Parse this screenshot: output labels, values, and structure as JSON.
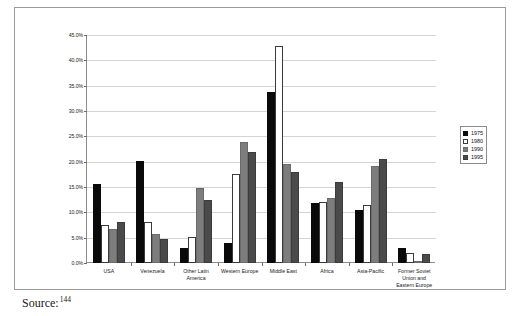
{
  "document": {
    "source_label": "Source:",
    "source_footnote": "144"
  },
  "legend": {
    "position": "right",
    "entries": [
      {
        "label": "1975",
        "color": "#0a0a0a"
      },
      {
        "label": "1980",
        "color": "#ffffff"
      },
      {
        "label": "1990",
        "color": "#7d7d7d"
      },
      {
        "label": "1995",
        "color": "#4a4a4a"
      }
    ]
  },
  "axis": {
    "y_ticks": [
      "0.0%",
      "5.0%",
      "10.0%",
      "15.0%",
      "20.0%",
      "25.0%",
      "30.0%",
      "35.0%",
      "40.0%",
      "45.0%"
    ]
  },
  "chart_data": {
    "type": "bar",
    "title": "",
    "subtitle": "",
    "xlabel": "",
    "ylabel": "",
    "ylim": [
      0,
      45
    ],
    "ytick_step": 5,
    "ytick_format": "percent",
    "grid": true,
    "legend_position": "right",
    "categories": [
      "USA",
      "Venezuela",
      "Other Latin\nAmerica",
      "Western Europe",
      "Middle East",
      "Africa",
      "Asia-Pacific",
      "Former Soviet\nUnion and\nEastern Europe"
    ],
    "series": [
      {
        "name": "1975",
        "color": "#0a0a0a",
        "values": [
          15.5,
          20.2,
          3.0,
          4.0,
          33.8,
          11.8,
          10.5,
          3.0
        ]
      },
      {
        "name": "1980",
        "color": "#ffffff",
        "values": [
          7.6,
          8.0,
          5.2,
          17.5,
          42.8,
          12.0,
          11.5,
          2.0
        ]
      },
      {
        "name": "1990",
        "color": "#7d7d7d",
        "values": [
          6.7,
          5.8,
          14.8,
          23.8,
          19.5,
          12.8,
          19.2,
          0.2
        ]
      },
      {
        "name": "1995",
        "color": "#4a4a4a",
        "values": [
          8.0,
          4.8,
          12.5,
          22.0,
          18.0,
          16.0,
          20.5,
          1.8
        ]
      }
    ]
  }
}
